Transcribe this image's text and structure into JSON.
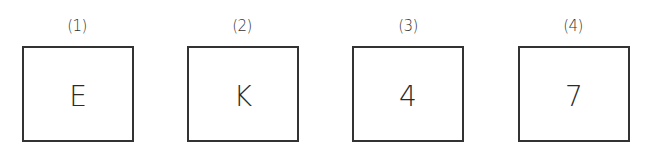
{
  "items": [
    {
      "label": "(1)",
      "value": "E"
    },
    {
      "label": "(2)",
      "value": "K"
    },
    {
      "label": "(3)",
      "value": "4"
    },
    {
      "label": "(4)",
      "value": "7"
    }
  ]
}
